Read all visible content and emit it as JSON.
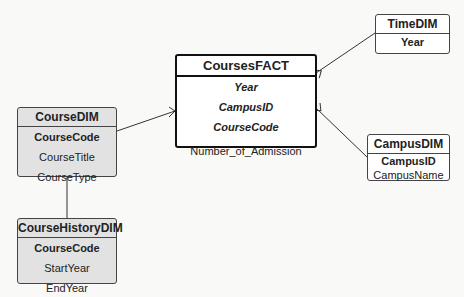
{
  "entities": {
    "fact": {
      "title": "CoursesFACT",
      "keys": [
        "Year",
        "CampusID",
        "CourseCode"
      ],
      "measure": "Number_of_Admission"
    },
    "course_dim": {
      "title": "CourseDIM",
      "key": "CourseCode",
      "attrs": [
        "CourseTitle",
        "CourseType"
      ]
    },
    "course_history_dim": {
      "title": "CourseHistoryDIM",
      "key": "CourseCode",
      "attrs": [
        "StartYear",
        "EndYear"
      ]
    },
    "time_dim": {
      "title": "TimeDIM",
      "key": "Year"
    },
    "campus_dim": {
      "title": "CampusDIM",
      "key": "CampusID",
      "attrs": [
        "CampusName"
      ]
    }
  },
  "relationships": [
    {
      "from": "CourseDIM",
      "to": "CoursesFACT",
      "type": "one-to-many"
    },
    {
      "from": "TimeDIM",
      "to": "CoursesFACT",
      "type": "one-to-many"
    },
    {
      "from": "CampusDIM",
      "to": "CoursesFACT",
      "type": "one-to-many"
    },
    {
      "from": "CourseDIM",
      "to": "CourseHistoryDIM",
      "type": "one-to-one"
    }
  ],
  "colors": {
    "background": "#f9f9f8",
    "dim_gray_fill": "#e2e2e2",
    "border": "#444444"
  }
}
